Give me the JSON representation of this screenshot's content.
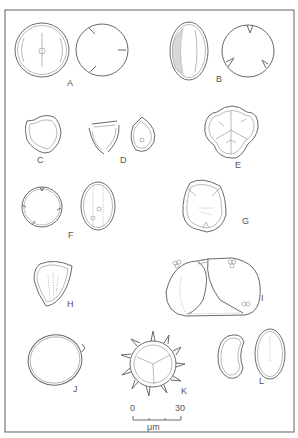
{
  "figure": {
    "panels": [
      {
        "id": "A",
        "label": "A"
      },
      {
        "id": "B",
        "label": "B"
      },
      {
        "id": "C",
        "label": "C"
      },
      {
        "id": "D",
        "label": "D"
      },
      {
        "id": "E",
        "label": "E"
      },
      {
        "id": "F",
        "label": "F"
      },
      {
        "id": "G",
        "label": "G"
      },
      {
        "id": "H",
        "label": "H"
      },
      {
        "id": "I",
        "label": "I"
      },
      {
        "id": "J",
        "label": "J"
      },
      {
        "id": "K",
        "label": "K"
      },
      {
        "id": "L",
        "label": "L"
      }
    ],
    "scale_bar": {
      "min_label": "0",
      "max_label": "30",
      "unit": "μm"
    }
  }
}
